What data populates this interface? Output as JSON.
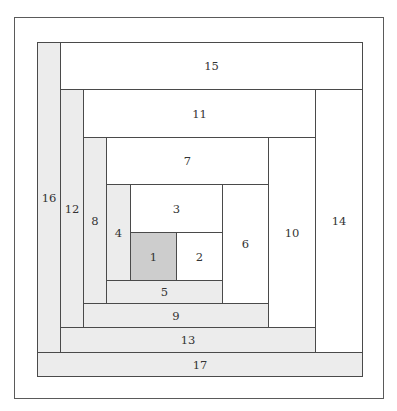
{
  "diagram": {
    "title": "",
    "type": "log-cabin-quilt-block",
    "colors": {
      "center": "#cdcdcd",
      "light": "#ececec",
      "white": "#ffffff",
      "stroke": "#4a4a4a"
    },
    "blocks": [
      {
        "label": "1",
        "x": 130,
        "y": 232,
        "w": 46,
        "h": 48,
        "fill": "dark"
      },
      {
        "label": "2",
        "x": 176,
        "y": 232,
        "w": 46,
        "h": 48,
        "fill": "white"
      },
      {
        "label": "3",
        "x": 130,
        "y": 184,
        "w": 92,
        "h": 48,
        "fill": "white"
      },
      {
        "label": "4",
        "x": 106,
        "y": 184,
        "w": 24,
        "h": 96,
        "fill": "light"
      },
      {
        "label": "5",
        "x": 106,
        "y": 280,
        "w": 116,
        "h": 23,
        "fill": "light"
      },
      {
        "label": "6",
        "x": 222,
        "y": 184,
        "w": 46,
        "h": 119,
        "fill": "white"
      },
      {
        "label": "7",
        "x": 106,
        "y": 137,
        "w": 162,
        "h": 47,
        "fill": "white"
      },
      {
        "label": "8",
        "x": 83,
        "y": 137,
        "w": 23,
        "h": 166,
        "fill": "light"
      },
      {
        "label": "9",
        "x": 83,
        "y": 303,
        "w": 185,
        "h": 24,
        "fill": "light"
      },
      {
        "label": "10",
        "x": 268,
        "y": 137,
        "w": 47,
        "h": 190,
        "fill": "white"
      },
      {
        "label": "11",
        "x": 83,
        "y": 89,
        "w": 232,
        "h": 48,
        "fill": "white"
      },
      {
        "label": "12",
        "x": 60,
        "y": 89,
        "w": 23,
        "h": 238,
        "fill": "light"
      },
      {
        "label": "13",
        "x": 60,
        "y": 327,
        "w": 255,
        "h": 25,
        "fill": "light"
      },
      {
        "label": "14",
        "x": 315,
        "y": 89,
        "w": 47,
        "h": 263,
        "fill": "white"
      },
      {
        "label": "15",
        "x": 60,
        "y": 42,
        "w": 302,
        "h": 47,
        "fill": "white"
      },
      {
        "label": "16",
        "x": 37,
        "y": 42,
        "w": 23,
        "h": 310,
        "fill": "light"
      },
      {
        "label": "17",
        "x": 37,
        "y": 352,
        "w": 325,
        "h": 24,
        "fill": "light"
      }
    ]
  }
}
